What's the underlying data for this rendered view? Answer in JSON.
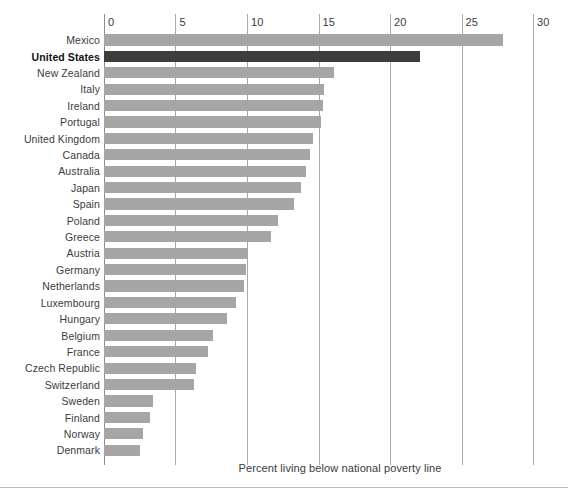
{
  "chart_data": {
    "type": "bar",
    "orientation": "horizontal",
    "title": "",
    "subtitle": "",
    "xlabel": "Percent living below national poverty line",
    "ylabel": "",
    "xlim": [
      0,
      30
    ],
    "xticks": [
      0,
      5,
      10,
      15,
      20,
      25,
      30
    ],
    "xticklabels": [
      "0",
      "5",
      "10",
      "15",
      "20",
      "25",
      "30"
    ],
    "grid": "vertical",
    "legend": "none",
    "highlight_category": "United States",
    "colors": {
      "bar": "#a6a6a6",
      "bar_highlight": "#3d3d3d",
      "gridline": "#a9a9a9",
      "text": "#3a3a3a",
      "background": "#ffffff"
    },
    "categories": [
      "Mexico",
      "United States",
      "New Zealand",
      "Italy",
      "Ireland",
      "Portugal",
      "United Kingdom",
      "Canada",
      "Australia",
      "Japan",
      "Spain",
      "Poland",
      "Greece",
      "Austria",
      "Germany",
      "Netherlands",
      "Luxembourg",
      "Hungary",
      "Belgium",
      "France",
      "Czech Republic",
      "Switzerland",
      "Sweden",
      "Finland",
      "Norway",
      "Denmark"
    ],
    "values": [
      27.9,
      22.1,
      16.1,
      15.4,
      15.3,
      15.2,
      14.6,
      14.4,
      14.1,
      13.8,
      13.3,
      12.2,
      11.7,
      10.1,
      9.9,
      9.8,
      9.2,
      8.6,
      7.6,
      7.3,
      6.4,
      6.3,
      3.4,
      3.2,
      2.7,
      2.5
    ],
    "annotations": []
  },
  "caption": {
    "text": "Percent living below national poverty line"
  }
}
